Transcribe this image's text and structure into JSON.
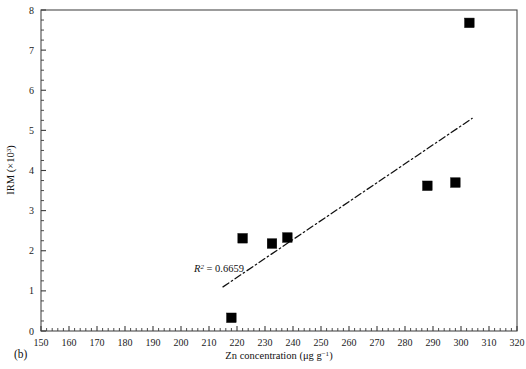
{
  "figure": {
    "panel_label": "(b)",
    "background_color": "#ffffff",
    "marker_color": "#000000",
    "axis_color": "#4b4b4b"
  },
  "chart_data": {
    "type": "scatter",
    "title": "",
    "xlabel": "Zn concentration (μg g⁻¹)",
    "xlabel_parts": {
      "main": "Zn concentration (μg g",
      "exponent": "−1",
      "tail": ")"
    },
    "ylabel": "IRM (×10³)",
    "ylabel_parts": {
      "main": "IRM (×10",
      "exponent": "3",
      "tail": ")"
    },
    "xlim": [
      150,
      320
    ],
    "ylim": [
      0,
      8
    ],
    "xticks": [
      150,
      160,
      170,
      180,
      190,
      200,
      210,
      220,
      230,
      240,
      250,
      260,
      270,
      280,
      290,
      300,
      310,
      320
    ],
    "xtick_labels": [
      "150",
      "160",
      "170",
      "180",
      "190",
      "200",
      "210",
      "220",
      "230",
      "240",
      "250",
      "260",
      "270",
      "280",
      "290",
      "300",
      "310",
      "320"
    ],
    "x_minor_interval": 2,
    "yticks": [
      0,
      1,
      2,
      3,
      4,
      5,
      6,
      7,
      8
    ],
    "ytick_labels": [
      "0",
      "1",
      "2",
      "3",
      "4",
      "5",
      "6",
      "7",
      "8"
    ],
    "y_minor_interval": 0.25,
    "grid": false,
    "legend": false,
    "marker_shape": "filled-square",
    "points": [
      {
        "x": 218.0,
        "y": 0.33
      },
      {
        "x": 222.0,
        "y": 2.31
      },
      {
        "x": 232.5,
        "y": 2.18
      },
      {
        "x": 238.0,
        "y": 2.33
      },
      {
        "x": 288.0,
        "y": 3.62
      },
      {
        "x": 298.0,
        "y": 3.7
      },
      {
        "x": 303.0,
        "y": 7.68
      }
    ],
    "trendline": {
      "style": "dash-dot",
      "x_start": 215.0,
      "y_start": 1.1,
      "x_end": 304.0,
      "y_end": 5.3
    },
    "annotations": [
      {
        "name": "r-squared",
        "text": "R2 = 0.6659",
        "symbol": "R",
        "exponent": "2",
        "value_text": " = 0.6659",
        "x_px": 194,
        "y_px": 272
      }
    ]
  }
}
